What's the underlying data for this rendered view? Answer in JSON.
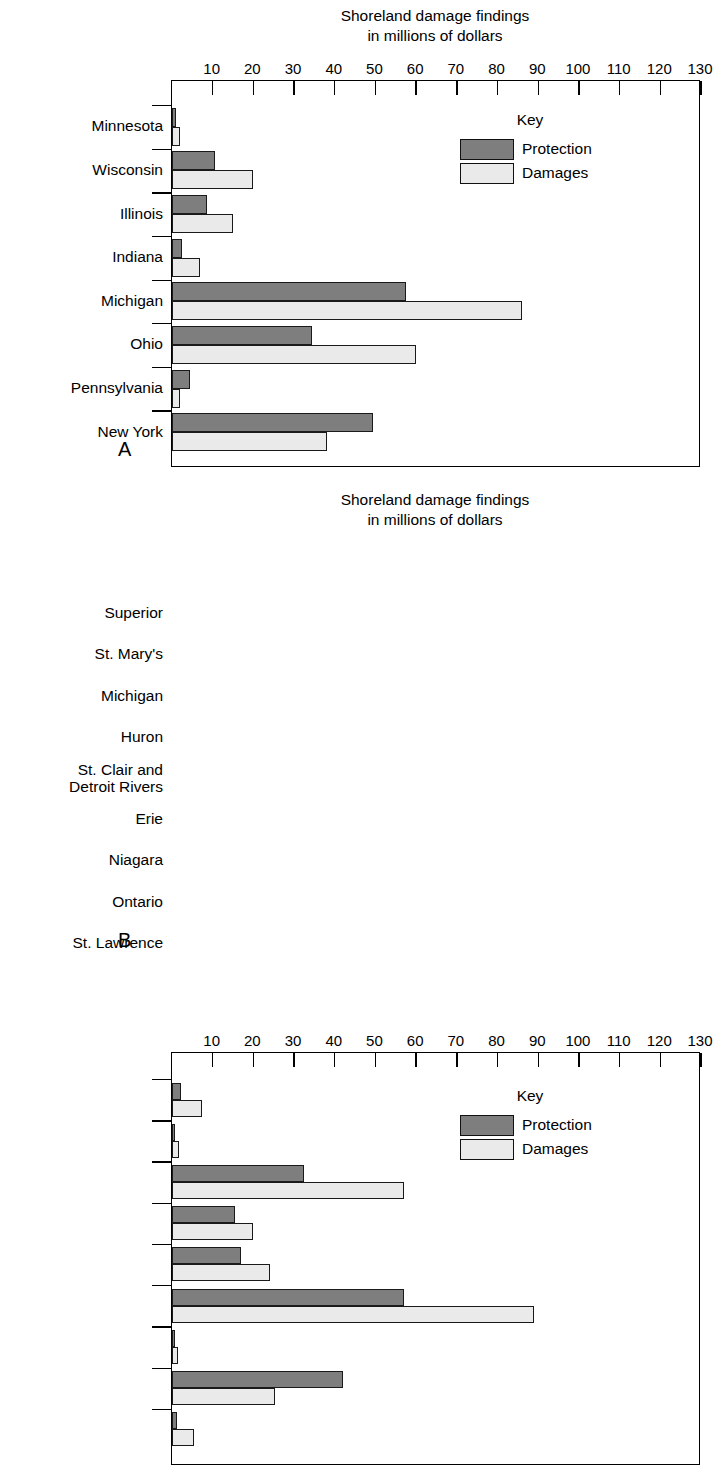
{
  "figure": {
    "background": "#ffffff",
    "colors": {
      "protection": "#7e7e7e",
      "damages": "#eaeaea",
      "outline": "#1a1a1a"
    }
  },
  "legend": {
    "title": "Key",
    "items": [
      {
        "label": "Protection",
        "color": "#7e7e7e"
      },
      {
        "label": "Damages",
        "color": "#eaeaea"
      }
    ]
  },
  "panels": [
    {
      "letter": "A"
    },
    {
      "letter": "B"
    }
  ],
  "chart_data": [
    {
      "id": "panel-a",
      "type": "bar",
      "orientation": "horizontal",
      "title": "Shoreland damage findings\nin millions of dollars",
      "xlabel": "",
      "ylabel": "",
      "xlim": [
        0,
        130
      ],
      "xticks": [
        10,
        20,
        30,
        40,
        50,
        60,
        70,
        80,
        90,
        100,
        110,
        120,
        130
      ],
      "xticklabels": [
        "10",
        "20",
        "30",
        "40",
        "50",
        "60",
        "70",
        "80",
        "90",
        "100",
        "110",
        "120",
        "130"
      ],
      "grid": false,
      "legend_position": "inside upper right",
      "categories": [
        "Minnesota",
        "Wisconsin",
        "Illinois",
        "Indiana",
        "Michigan",
        "Ohio",
        "Pennsylvania",
        "New York"
      ],
      "series": [
        {
          "name": "Protection",
          "values": [
            1.0,
            10.5,
            8.5,
            2.4,
            57.5,
            34.5,
            4.5,
            49.5
          ]
        },
        {
          "name": "Damages",
          "values": [
            2.0,
            20.0,
            15.0,
            6.8,
            86.0,
            60.0,
            2.0,
            38.0
          ]
        }
      ]
    },
    {
      "id": "panel-b",
      "type": "bar",
      "orientation": "horizontal",
      "title": "Shoreland damage findings\nin millions of dollars",
      "xlabel": "",
      "ylabel": "",
      "xlim": [
        0,
        130
      ],
      "xticks": [
        10,
        20,
        30,
        40,
        50,
        60,
        70,
        80,
        90,
        100,
        110,
        120,
        130
      ],
      "xticklabels": [
        "10",
        "20",
        "30",
        "40",
        "50",
        "60",
        "70",
        "80",
        "90",
        "100",
        "110",
        "120",
        "130"
      ],
      "grid": false,
      "legend_position": "inside upper right",
      "categories": [
        "Superior",
        "St. Mary's",
        "Michigan",
        "Huron",
        "St. Clair and\nDetroit Rivers",
        "Erie",
        "Niagara",
        "Ontario",
        "St. Lawrence"
      ],
      "series": [
        {
          "name": "Protection",
          "values": [
            2.2,
            0.8,
            32.5,
            15.5,
            17.0,
            57.0,
            0.8,
            42.0,
            1.2
          ]
        },
        {
          "name": "Damages",
          "values": [
            7.3,
            1.6,
            57.0,
            19.8,
            24.0,
            89.0,
            1.4,
            25.4,
            5.4
          ]
        }
      ]
    }
  ]
}
